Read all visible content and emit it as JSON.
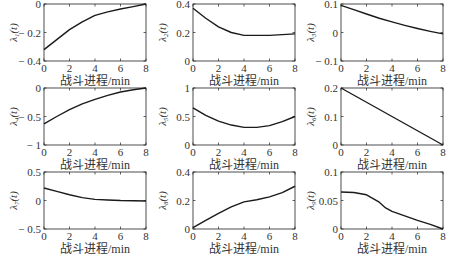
{
  "chart_data": [
    {
      "type": "line",
      "ylabel": "λ1(t)",
      "ylabel_sub": "1",
      "xlabel": "战斗进程/min",
      "xlim": [
        0,
        8
      ],
      "ylim": [
        -0.4,
        0
      ],
      "xticks": [
        "0",
        "2",
        "4",
        "6",
        "8"
      ],
      "yticks": [
        "-0.4",
        "-0.2",
        "0"
      ],
      "ytick_vals": [
        -0.4,
        -0.2,
        0
      ],
      "series": [
        {
          "name": "λ1",
          "x": [
            0,
            1,
            2,
            3,
            4,
            5,
            6,
            7,
            8
          ],
          "y": [
            -0.32,
            -0.25,
            -0.18,
            -0.125,
            -0.08,
            -0.055,
            -0.035,
            -0.018,
            0
          ]
        }
      ]
    },
    {
      "type": "line",
      "ylabel": "λ2(t)",
      "ylabel_sub": "2",
      "xlabel": "战斗进程/min",
      "xlim": [
        0,
        8
      ],
      "ylim": [
        0,
        0.4
      ],
      "xticks": [
        "0",
        "2",
        "4",
        "6",
        "8"
      ],
      "yticks": [
        "0",
        "0.2",
        "0.4"
      ],
      "ytick_vals": [
        0,
        0.2,
        0.4
      ],
      "series": [
        {
          "name": "λ2",
          "x": [
            0,
            1,
            2,
            3,
            4,
            5,
            6,
            7,
            8
          ],
          "y": [
            0.37,
            0.3,
            0.24,
            0.2,
            0.18,
            0.18,
            0.18,
            0.185,
            0.19
          ]
        }
      ]
    },
    {
      "type": "line",
      "ylabel": "λ3(t)",
      "ylabel_sub": "3",
      "xlabel": "战斗进程/min",
      "xlim": [
        0,
        8
      ],
      "ylim": [
        -0.1,
        0.1
      ],
      "xticks": [
        "0",
        "2",
        "4",
        "6",
        "8"
      ],
      "yticks": [
        "-0.1",
        "0",
        "0.1"
      ],
      "ytick_vals": [
        -0.1,
        0,
        0.1
      ],
      "series": [
        {
          "name": "λ3",
          "x": [
            0,
            1,
            2,
            3,
            4,
            5,
            6,
            7,
            8
          ],
          "y": [
            0.095,
            0.08,
            0.065,
            0.05,
            0.037,
            0.025,
            0.014,
            0.004,
            -0.005
          ]
        }
      ]
    },
    {
      "type": "line",
      "ylabel": "λ4(t)",
      "ylabel_sub": "4",
      "xlabel": "战斗进程/min",
      "xlim": [
        0,
        8
      ],
      "ylim": [
        -1,
        0
      ],
      "xticks": [
        "0",
        "2",
        "4",
        "6",
        "8"
      ],
      "yticks": [
        "-1",
        "-0.5",
        "0"
      ],
      "ytick_vals": [
        -1,
        -0.5,
        0
      ],
      "series": [
        {
          "name": "λ4",
          "x": [
            0,
            1,
            2,
            3,
            4,
            5,
            6,
            7,
            8
          ],
          "y": [
            -0.63,
            -0.5,
            -0.38,
            -0.28,
            -0.2,
            -0.13,
            -0.07,
            -0.03,
            0
          ]
        }
      ]
    },
    {
      "type": "line",
      "ylabel": "λ5(t)",
      "ylabel_sub": "5",
      "xlabel": "战斗进程/min",
      "xlim": [
        0,
        8
      ],
      "ylim": [
        0,
        1
      ],
      "xticks": [
        "0",
        "2",
        "4",
        "6",
        "8"
      ],
      "yticks": [
        "0",
        "0.5",
        "1"
      ],
      "ytick_vals": [
        0,
        0.5,
        1
      ],
      "series": [
        {
          "name": "λ5",
          "x": [
            0,
            1,
            2,
            3,
            4,
            5,
            6,
            7,
            8
          ],
          "y": [
            0.65,
            0.52,
            0.42,
            0.35,
            0.31,
            0.31,
            0.34,
            0.41,
            0.5
          ]
        }
      ]
    },
    {
      "type": "line",
      "ylabel": "λ6(t)",
      "ylabel_sub": "6",
      "xlabel": "战斗进程/min",
      "xlim": [
        0,
        8
      ],
      "ylim": [
        0,
        0.2
      ],
      "xticks": [
        "0",
        "2",
        "4",
        "6",
        "8"
      ],
      "yticks": [
        "0",
        "0.1",
        "0.2"
      ],
      "ytick_vals": [
        0,
        0.1,
        0.2
      ],
      "series": [
        {
          "name": "λ6",
          "x": [
            0,
            2,
            4,
            6,
            8
          ],
          "y": [
            0.2,
            0.15,
            0.1,
            0.05,
            0
          ]
        }
      ]
    },
    {
      "type": "line",
      "ylabel": "λ7(t)",
      "ylabel_sub": "7",
      "xlabel": "战斗进程/min",
      "xlim": [
        0,
        8
      ],
      "ylim": [
        -0.5,
        0.5
      ],
      "xticks": [
        "0",
        "2",
        "4",
        "6",
        "8"
      ],
      "yticks": [
        "-0.5",
        "0",
        "0.5"
      ],
      "ytick_vals": [
        -0.5,
        0,
        0.5
      ],
      "series": [
        {
          "name": "λ7",
          "x": [
            0,
            1,
            2,
            3,
            4,
            5,
            6,
            7,
            8
          ],
          "y": [
            0.22,
            0.16,
            0.1,
            0.05,
            0.02,
            0.01,
            0.0,
            -0.005,
            -0.01
          ]
        }
      ]
    },
    {
      "type": "line",
      "ylabel": "λ8(t)",
      "ylabel_sub": "8",
      "xlabel": "战斗进程/min",
      "xlim": [
        0,
        8
      ],
      "ylim": [
        0,
        0.4
      ],
      "xticks": [
        "0",
        "2",
        "4",
        "6",
        "8"
      ],
      "yticks": [
        "0",
        "0.2",
        "0.4"
      ],
      "ytick_vals": [
        0,
        0.2,
        0.4
      ],
      "series": [
        {
          "name": "λ8",
          "x": [
            0,
            1,
            2,
            3,
            4,
            5,
            6,
            7,
            8
          ],
          "y": [
            0.01,
            0.06,
            0.11,
            0.155,
            0.19,
            0.205,
            0.225,
            0.255,
            0.3
          ]
        }
      ]
    },
    {
      "type": "line",
      "ylabel": "λ9(t)",
      "ylabel_sub": "9",
      "xlabel": "战斗进程/min",
      "xlim": [
        0,
        8
      ],
      "ylim": [
        0,
        0.1
      ],
      "xticks": [
        "0",
        "2",
        "4",
        "6",
        "8"
      ],
      "yticks": [
        "0",
        "0.05",
        "0.1"
      ],
      "ytick_vals": [
        0,
        0.05,
        0.1
      ],
      "series": [
        {
          "name": "λ9",
          "x": [
            0,
            1,
            2,
            3,
            3.5,
            4,
            5,
            6,
            7,
            8
          ],
          "y": [
            0.065,
            0.064,
            0.06,
            0.047,
            0.037,
            0.031,
            0.023,
            0.015,
            0.008,
            0
          ]
        }
      ]
    }
  ]
}
